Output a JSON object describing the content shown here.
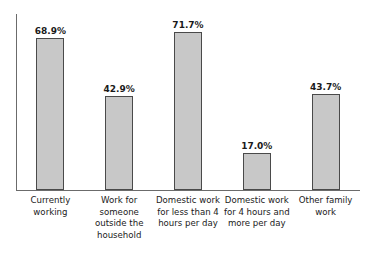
{
  "chart_data": {
    "type": "bar",
    "title": "",
    "xlabel": "",
    "ylabel": "",
    "ylim": [
      0,
      80
    ],
    "grid": false,
    "legend": false,
    "value_suffix": "%",
    "categories": [
      "Currently working",
      "Work for someone outside the household",
      "Domestic work for less than 4 hours per day",
      "Domestic work for 4 hours and more per day",
      "Other family work"
    ],
    "values": [
      68.9,
      42.9,
      71.7,
      17.0,
      43.7
    ],
    "value_labels": [
      "68.9%",
      "42.9%",
      "71.7%",
      "17.0%",
      "43.7%"
    ],
    "colors": {
      "bar_fill": "#c8c8c8",
      "bar_border": "#4a4a4a",
      "axis": "#6b6b6b",
      "text": "#1a1a1a",
      "background": "#ffffff"
    }
  }
}
